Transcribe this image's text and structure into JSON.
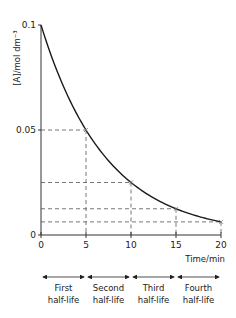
{
  "chart_data": {
    "type": "line",
    "title": "",
    "xlabel": "Time/min",
    "ylabel": "[A]/mol dm⁻³",
    "xlim": [
      0,
      20
    ],
    "ylim": [
      0,
      0.1
    ],
    "x_ticks": [
      "0",
      "5",
      "10",
      "15",
      "20"
    ],
    "y_ticks": [
      "0",
      "0.05",
      "0.1"
    ],
    "grid": false,
    "series": [
      {
        "name": "[A]",
        "x": [
          0,
          5,
          10,
          15,
          20
        ],
        "values": [
          0.1,
          0.05,
          0.025,
          0.0125,
          0.00625
        ]
      }
    ],
    "marked_points": [
      {
        "x": 5,
        "y": 0.05
      },
      {
        "x": 10,
        "y": 0.025
      },
      {
        "x": 15,
        "y": 0.0125
      },
      {
        "x": 20,
        "y": 0.00625
      }
    ],
    "annotations": [
      {
        "label_line1": "First",
        "label_line2": "half-life",
        "from": 0,
        "to": 5
      },
      {
        "label_line1": "Second",
        "label_line2": "half-life",
        "from": 5,
        "to": 10
      },
      {
        "label_line1": "Third",
        "label_line2": "half-life",
        "from": 10,
        "to": 15
      },
      {
        "label_line1": "Fourth",
        "label_line2": "half-life",
        "from": 15,
        "to": 20
      }
    ]
  },
  "colors": {
    "curve": "#1a1a1a",
    "axis": "#333333",
    "dashed": "#555555",
    "text": "#222222"
  }
}
